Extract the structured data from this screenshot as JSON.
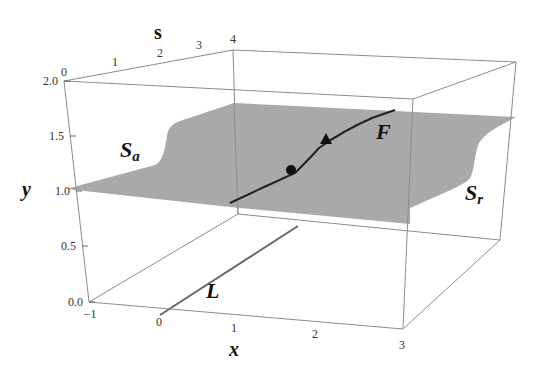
{
  "figure": {
    "axes": {
      "x": {
        "label": "x",
        "ticks": [
          "−1",
          "0",
          "1",
          "2",
          "3"
        ],
        "range": [
          -1,
          3
        ]
      },
      "y": {
        "label": "y",
        "ticks": [
          "0.0",
          "0.5",
          "1.0",
          "1.5",
          "2.0"
        ],
        "range": [
          0,
          2
        ]
      },
      "s": {
        "label": "s",
        "ticks": [
          "0",
          "1",
          "2",
          "3",
          "4"
        ],
        "range": [
          0,
          4
        ]
      }
    },
    "labels": {
      "Sa": {
        "main": "S",
        "sub": "a"
      },
      "Sr": {
        "main": "S",
        "sub": "r"
      },
      "F": "F",
      "L": "L"
    },
    "colors": {
      "surface": "#a9a9a9",
      "box": "#8c8c8c",
      "curve": "#222222",
      "L_line": "#666666"
    }
  }
}
